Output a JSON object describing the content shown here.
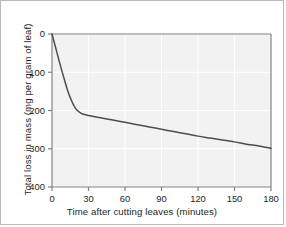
{
  "chart_data": {
    "type": "line",
    "title": "",
    "xlabel": "Time after cutting leaves (minutes)",
    "ylabel": "Total loss in mass (mg per gram of leaf)",
    "xlim": [
      0,
      180
    ],
    "ylim": [
      0,
      400
    ],
    "y_axis_inverted": true,
    "xticks": [
      0,
      30,
      60,
      90,
      120,
      150,
      180
    ],
    "yticks": [
      0,
      100,
      200,
      300,
      400
    ],
    "xtick_labels": [
      "0",
      "30",
      "60",
      "90",
      "120",
      "150",
      "180"
    ],
    "ytick_labels": [
      "0",
      "100",
      "200",
      "300",
      "400"
    ],
    "grid": true,
    "legend": null,
    "series": [
      {
        "name": "Total loss in mass",
        "x": [
          0,
          2,
          4,
          6,
          8,
          10,
          12,
          14,
          16,
          18,
          20,
          22,
          25,
          30,
          40,
          50,
          60,
          70,
          80,
          90,
          100,
          110,
          120,
          130,
          140,
          150,
          160,
          170,
          180
        ],
        "values": [
          0,
          24,
          48,
          72,
          95,
          117,
          139,
          158,
          174,
          187,
          197,
          203,
          209,
          213,
          219,
          225,
          231,
          237,
          243,
          249,
          255,
          261,
          267,
          272,
          277,
          282,
          288,
          293,
          299
        ]
      }
    ]
  },
  "figure": {
    "line_color": "#4d4d4d",
    "plot_background": "#f2f2f2",
    "grid_color": "#ffffff",
    "axis_color": "#808080",
    "text_color": "#231f20",
    "border_color": "#b9b9b9"
  }
}
